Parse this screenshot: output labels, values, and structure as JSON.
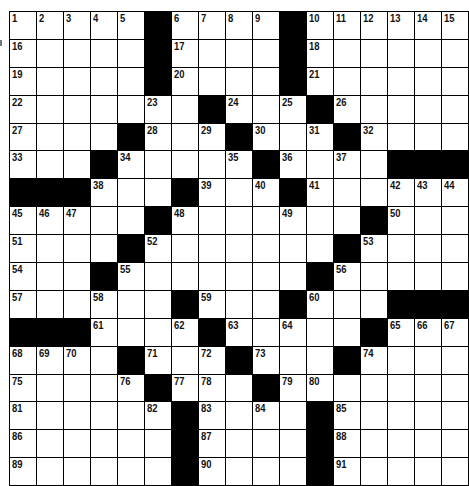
{
  "puzzle": {
    "rows": 17,
    "cols": 17,
    "grid": [
      [
        1,
        2,
        3,
        4,
        5,
        "#",
        6,
        7,
        8,
        9,
        "#",
        10,
        11,
        12,
        13,
        14,
        15
      ],
      [
        16,
        0,
        0,
        0,
        0,
        "#",
        17,
        0,
        0,
        0,
        "#",
        18,
        0,
        0,
        0,
        0,
        0
      ],
      [
        19,
        0,
        0,
        0,
        0,
        "#",
        20,
        0,
        0,
        0,
        "#",
        21,
        0,
        0,
        0,
        0,
        0
      ],
      [
        22,
        0,
        0,
        0,
        0,
        23,
        0,
        "#",
        24,
        0,
        25,
        "#",
        26,
        0,
        0,
        0,
        0
      ],
      [
        27,
        0,
        0,
        0,
        "#",
        28,
        0,
        29,
        "#",
        30,
        0,
        31,
        "#",
        32,
        0,
        0,
        0
      ],
      [
        33,
        0,
        0,
        "#",
        34,
        0,
        0,
        0,
        35,
        "#",
        36,
        0,
        37,
        0,
        "#",
        "#",
        "#"
      ],
      [
        "#",
        "#",
        "#",
        38,
        0,
        0,
        "#",
        39,
        0,
        40,
        "#",
        41,
        0,
        0,
        42,
        43,
        44
      ],
      [
        45,
        46,
        47,
        0,
        0,
        "#",
        48,
        0,
        0,
        0,
        49,
        0,
        0,
        "#",
        50,
        0,
        0
      ],
      [
        51,
        0,
        0,
        0,
        "#",
        52,
        0,
        0,
        0,
        0,
        0,
        0,
        "#",
        53,
        0,
        0,
        0
      ],
      [
        54,
        0,
        0,
        "#",
        55,
        0,
        0,
        0,
        0,
        0,
        0,
        "#",
        56,
        0,
        0,
        0,
        0
      ],
      [
        57,
        0,
        0,
        58,
        0,
        0,
        "#",
        59,
        0,
        0,
        "#",
        60,
        0,
        0,
        "#",
        "#",
        "#"
      ],
      [
        "#",
        "#",
        "#",
        61,
        0,
        0,
        62,
        "#",
        63,
        0,
        64,
        0,
        0,
        "#",
        65,
        66,
        67
      ],
      [
        68,
        69,
        70,
        0,
        "#",
        71,
        0,
        72,
        "#",
        73,
        0,
        0,
        "#",
        74,
        0,
        0,
        0
      ],
      [
        75,
        0,
        0,
        0,
        76,
        "#",
        77,
        78,
        0,
        "#",
        79,
        80,
        0,
        0,
        0,
        0,
        0
      ],
      [
        81,
        0,
        0,
        0,
        0,
        82,
        "#",
        83,
        0,
        84,
        0,
        "#",
        85,
        0,
        0,
        0,
        0
      ],
      [
        86,
        0,
        0,
        0,
        0,
        0,
        "#",
        87,
        0,
        0,
        0,
        "#",
        88,
        0,
        0,
        0,
        0
      ],
      [
        89,
        0,
        0,
        0,
        0,
        0,
        "#",
        90,
        0,
        0,
        0,
        "#",
        91,
        0,
        0,
        0,
        0
      ]
    ]
  }
}
